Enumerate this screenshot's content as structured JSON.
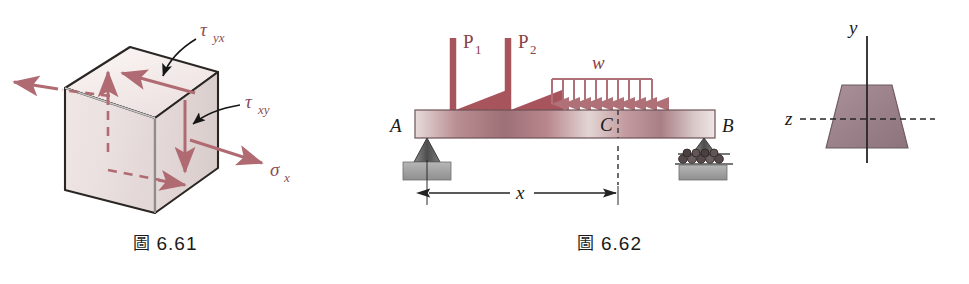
{
  "figures": [
    {
      "id": "fig-6-61",
      "caption_prefix": "圖",
      "caption_number": "6.61",
      "type": "stress-element-cube",
      "labels": {
        "tau_yx": "τ",
        "tau_yx_sub": "yx",
        "tau_xy": "τ",
        "tau_xy_sub": "xy",
        "sigma_x": "σ",
        "sigma_x_sub": "x"
      },
      "colors": {
        "stress_arrow": "#b06b72",
        "cube_top": "#f3eceb",
        "cube_front": "#ece2e1",
        "cube_right": "#e2d6d6",
        "cube_edge": "#262220"
      }
    },
    {
      "id": "fig-6-62",
      "caption_prefix": "圖",
      "caption_number": "6.62",
      "type": "simply-supported-beam",
      "labels": {
        "point_load_1": "P",
        "point_load_1_sub": "1",
        "point_load_2": "P",
        "point_load_2_sub": "2",
        "distributed_load": "w",
        "support_a": "A",
        "section_c": "C",
        "support_b": "B",
        "dimension_x": "x",
        "axis_y": "y",
        "axis_z": "z"
      },
      "distributed_load_arrow_count": 10,
      "colors": {
        "beam_fill_dark": "#9d6f76",
        "beam_fill_light": "#e8dcdb",
        "load_arrow": "#a8545c",
        "w_arrow": "#b07078",
        "section_fill": "#9d8289",
        "ground": "#9c9c9c",
        "support": "#6f6f6f",
        "axis": "#2a2a2a"
      }
    }
  ]
}
